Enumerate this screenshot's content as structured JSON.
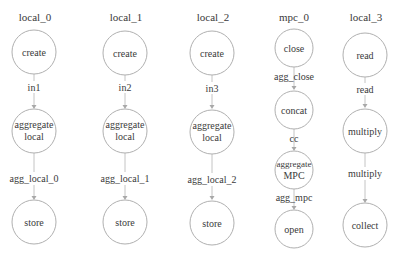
{
  "diagram": {
    "columns": [
      {
        "title": "local_0",
        "nodes": [
          {
            "lines": [
              "create"
            ]
          },
          {
            "lines": [
              "aggregate",
              "local"
            ]
          },
          {
            "lines": [
              "store"
            ]
          }
        ],
        "edges": [
          "in1",
          "agg_local_0"
        ]
      },
      {
        "title": "local_1",
        "nodes": [
          {
            "lines": [
              "create"
            ]
          },
          {
            "lines": [
              "aggregate",
              "local"
            ]
          },
          {
            "lines": [
              "store"
            ]
          }
        ],
        "edges": [
          "in2",
          "agg_local_1"
        ]
      },
      {
        "title": "local_2",
        "nodes": [
          {
            "lines": [
              "create"
            ]
          },
          {
            "lines": [
              "aggregate",
              "local"
            ]
          },
          {
            "lines": [
              "store"
            ]
          }
        ],
        "edges": [
          "in3",
          "agg_local_2"
        ]
      },
      {
        "title": "mpc_0",
        "nodes": [
          {
            "lines": [
              "close"
            ]
          },
          {
            "lines": [
              "concat"
            ]
          },
          {
            "lines": [
              "aggregate",
              "MPC"
            ]
          },
          {
            "lines": [
              "open"
            ]
          }
        ],
        "edges": [
          "agg_close",
          "cc",
          "agg_mpc"
        ]
      },
      {
        "title": "local_3",
        "nodes": [
          {
            "lines": [
              "read"
            ]
          },
          {
            "lines": [
              "multiply"
            ]
          },
          {
            "lines": [
              "collect"
            ]
          }
        ],
        "edges": [
          "read",
          "multiply"
        ]
      }
    ],
    "colors": {
      "node_stroke": "#b0b0b0",
      "edge": "#c4c4c4",
      "text": "#3a3a3a",
      "background": "#ffffff"
    }
  }
}
